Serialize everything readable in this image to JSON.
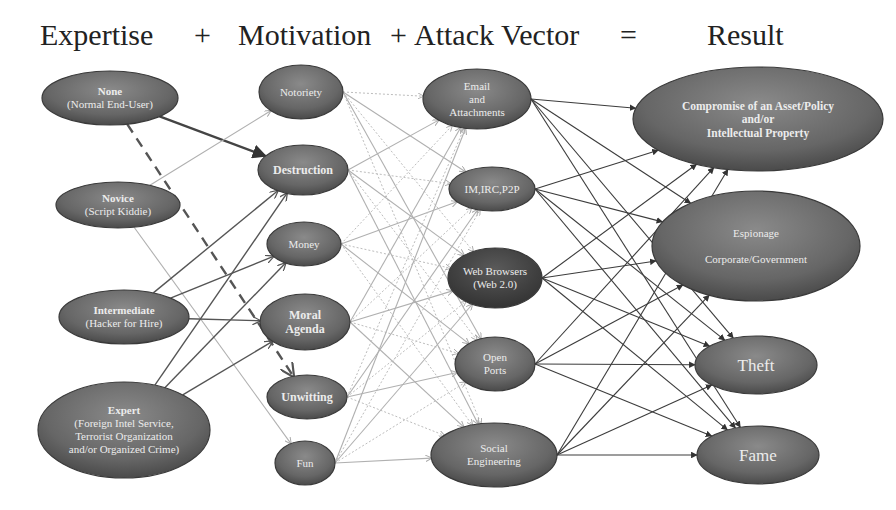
{
  "header": {
    "expertise": "Expertise",
    "plus1": "+",
    "motivation": "Motivation",
    "plus2": "+",
    "attack_vector": "Attack Vector",
    "equals": "=",
    "result": "Result"
  },
  "colors": {
    "node_fill": "#6e6e6e",
    "node_fill_dark": "#4a4a4a",
    "node_stroke": "#3a3a3a",
    "node_text": "#e8e8e8",
    "edge_dark": "#444444",
    "edge_light": "#b8b8b8",
    "header_text": "#222222"
  },
  "columns": {
    "expertise": [
      {
        "id": "none",
        "title": "None",
        "subtitle": "(Normal End-User)",
        "cx": 110,
        "cy": 98,
        "rx": 68,
        "ry": 27
      },
      {
        "id": "novice",
        "title": "Novice",
        "subtitle": "(Script Kiddie)",
        "cx": 118,
        "cy": 205,
        "rx": 62,
        "ry": 23
      },
      {
        "id": "intermediate",
        "title": "Intermediate",
        "subtitle": "(Hacker for Hire)",
        "cx": 124,
        "cy": 317,
        "rx": 65,
        "ry": 27
      },
      {
        "id": "expert",
        "title": "Expert",
        "subtitle_lines": [
          "(Foreign Intel Service,",
          "Terrorist Organization",
          "and/or Organized Crime)"
        ],
        "cx": 124,
        "cy": 430,
        "rx": 86,
        "ry": 48
      }
    ],
    "motivation": [
      {
        "id": "notoriety",
        "label": "Notoriety",
        "cx": 301,
        "cy": 92,
        "rx": 42,
        "ry": 27
      },
      {
        "id": "destruction",
        "label": "Destruction",
        "cx": 303,
        "cy": 170,
        "rx": 45,
        "ry": 25
      },
      {
        "id": "money",
        "label": "Money",
        "cx": 304,
        "cy": 244,
        "rx": 37,
        "ry": 22
      },
      {
        "id": "moral_agenda",
        "label_lines": [
          "Moral",
          "Agenda"
        ],
        "cx": 305,
        "cy": 322,
        "rx": 45,
        "ry": 28
      },
      {
        "id": "unwitting",
        "label": "Unwitting",
        "cx": 307,
        "cy": 397,
        "rx": 40,
        "ry": 22
      },
      {
        "id": "fun",
        "label": "Fun",
        "cx": 305,
        "cy": 463,
        "rx": 30,
        "ry": 22
      }
    ],
    "attack_vector": [
      {
        "id": "email",
        "label_lines": [
          "Email",
          "and",
          "Attachments"
        ],
        "cx": 477,
        "cy": 99,
        "rx": 54,
        "ry": 30
      },
      {
        "id": "im",
        "label": "IM,IRC,P2P",
        "cx": 492,
        "cy": 189,
        "rx": 43,
        "ry": 22
      },
      {
        "id": "web",
        "label_lines": [
          "Web Browsers",
          "(Web 2.0)"
        ],
        "cx": 495,
        "cy": 278,
        "rx": 47,
        "ry": 30,
        "dark": true
      },
      {
        "id": "ports",
        "label_lines": [
          "Open",
          "Ports"
        ],
        "cx": 495,
        "cy": 364,
        "rx": 40,
        "ry": 27
      },
      {
        "id": "social",
        "label_lines": [
          "Social",
          "Engineering"
        ],
        "cx": 494,
        "cy": 455,
        "rx": 63,
        "ry": 32
      }
    ],
    "result": [
      {
        "id": "compromise",
        "label_lines": [
          "Compromise of  an Asset/Policy",
          "and/or",
          "Intellectual Property"
        ],
        "cx": 758,
        "cy": 119,
        "rx": 125,
        "ry": 52,
        "bold": true
      },
      {
        "id": "espionage",
        "label_lines": [
          "Espionage",
          "",
          "Corporate/Government"
        ],
        "cx": 756,
        "cy": 246,
        "rx": 104,
        "ry": 55
      },
      {
        "id": "theft",
        "label": "Theft",
        "cx": 756,
        "cy": 365,
        "rx": 61,
        "ry": 29
      },
      {
        "id": "fame",
        "label": "Fame",
        "cx": 758,
        "cy": 455,
        "rx": 61,
        "ry": 29
      }
    ]
  },
  "edges": {
    "expertise_to_motivation": [
      {
        "from": "none",
        "to": "destruction",
        "style": "thick"
      },
      {
        "from": "none",
        "to": "unwitting",
        "style": "dashed"
      },
      {
        "from": "novice",
        "to": "notoriety",
        "style": "light"
      },
      {
        "from": "novice",
        "to": "fun",
        "style": "light"
      },
      {
        "from": "intermediate",
        "to": "destruction",
        "style": "medium"
      },
      {
        "from": "intermediate",
        "to": "money",
        "style": "medium"
      },
      {
        "from": "intermediate",
        "to": "moral_agenda",
        "style": "medium"
      },
      {
        "from": "expert",
        "to": "destruction",
        "style": "medium"
      },
      {
        "from": "expert",
        "to": "money",
        "style": "medium"
      },
      {
        "from": "expert",
        "to": "moral_agenda",
        "style": "medium"
      }
    ],
    "motivation_to_vector": "all-to-all",
    "vector_to_result": "all-to-all"
  }
}
